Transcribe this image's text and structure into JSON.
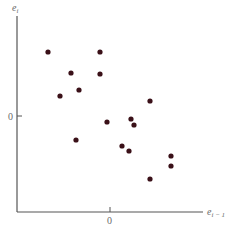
{
  "chart_data": {
    "type": "scatter",
    "title": "",
    "xlabel": "e_{i-1}",
    "ylabel": "e_i",
    "xlabel_text": "e",
    "xlabel_sub": "i − 1",
    "ylabel_text": "e",
    "ylabel_sub": "i",
    "x_ticks": [
      "0"
    ],
    "y_ticks": [
      "0"
    ],
    "grid": false,
    "legend": null,
    "marker_color": "#3a1018",
    "axis_color": "#555555",
    "note": "Residual e_i plotted against lagged residual e_{i-1}; values in pixel-relative units with origin at tick 0",
    "points_px": [
      [
        48,
        52
      ],
      [
        100,
        52
      ],
      [
        71,
        73
      ],
      [
        100,
        74
      ],
      [
        79,
        90
      ],
      [
        60,
        96
      ],
      [
        150,
        101
      ],
      [
        107,
        122
      ],
      [
        131,
        119
      ],
      [
        134,
        125
      ],
      [
        76,
        140
      ],
      [
        122,
        146
      ],
      [
        129,
        151
      ],
      [
        171,
        156
      ],
      [
        171,
        166
      ],
      [
        150,
        179
      ]
    ],
    "points": [
      {
        "x": -62,
        "y": 64
      },
      {
        "x": -10,
        "y": 64
      },
      {
        "x": -39,
        "y": 43
      },
      {
        "x": -10,
        "y": 42
      },
      {
        "x": -31,
        "y": 26
      },
      {
        "x": -50,
        "y": 20
      },
      {
        "x": 40,
        "y": 15
      },
      {
        "x": -3,
        "y": -6
      },
      {
        "x": 21,
        "y": -3
      },
      {
        "x": 24,
        "y": -9
      },
      {
        "x": -34,
        "y": -24
      },
      {
        "x": 12,
        "y": -30
      },
      {
        "x": 19,
        "y": -35
      },
      {
        "x": 61,
        "y": -40
      },
      {
        "x": 61,
        "y": -50
      },
      {
        "x": 40,
        "y": -63
      }
    ]
  }
}
